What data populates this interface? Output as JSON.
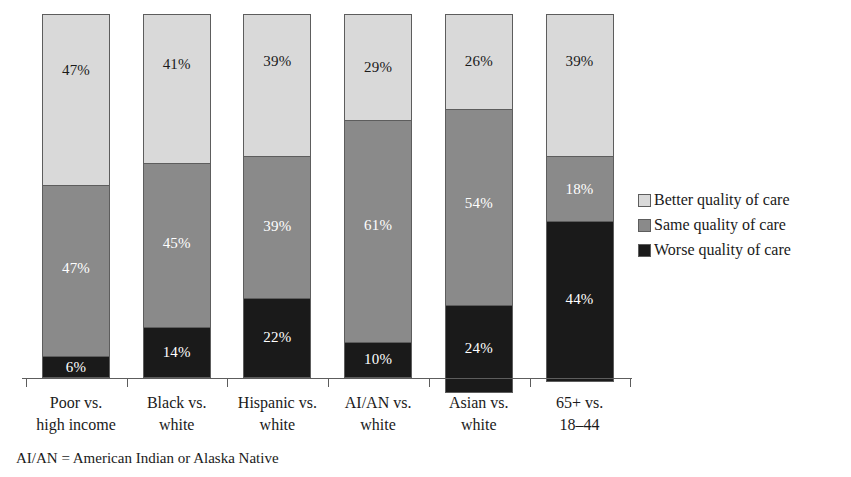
{
  "chart_data": {
    "type": "bar",
    "subtype": "stacked-100-percent",
    "title": "",
    "subtitle": "",
    "xlabel": "",
    "ylabel": "",
    "ylim": [
      0,
      100
    ],
    "grid": false,
    "legend_position": "right",
    "orientation": "vertical",
    "stack_order_bottom_to_top": [
      "Worse quality of care",
      "Same quality of care",
      "Better quality of care"
    ],
    "categories": [
      "Poor vs. high income",
      "Black vs. white",
      "Hispanic vs. white",
      "AI/AN vs. white",
      "Asian vs. white",
      "65+ vs. 18–44"
    ],
    "category_lines": [
      [
        "Poor vs.",
        "high income"
      ],
      [
        "Black vs.",
        "white"
      ],
      [
        "Hispanic vs.",
        "white"
      ],
      [
        "AI/AN vs.",
        "white"
      ],
      [
        "Asian vs.",
        "white"
      ],
      [
        "65+ vs.",
        "18–44"
      ]
    ],
    "series": [
      {
        "name": "Better quality of care",
        "color": "#d9d9d9",
        "values": [
          47,
          41,
          39,
          29,
          26,
          39
        ],
        "labels": [
          "47%",
          "41%",
          "39%",
          "29%",
          "26%",
          "39%"
        ]
      },
      {
        "name": "Same quality of care",
        "color": "#8a8a8a",
        "values": [
          47,
          45,
          39,
          61,
          54,
          18
        ],
        "labels": [
          "47%",
          "45%",
          "39%",
          "61%",
          "54%",
          "18%"
        ]
      },
      {
        "name": "Worse quality of care",
        "color": "#1a1a1a",
        "values": [
          6,
          14,
          22,
          10,
          24,
          44
        ],
        "labels": [
          "6%",
          "14%",
          "22%",
          "10%",
          "24%",
          "44%"
        ]
      }
    ],
    "annotations": [
      "AI/AN = American Indian or Alaska Native"
    ]
  },
  "legend": {
    "items": [
      {
        "label": "Better quality of care",
        "swatch": "legend-swatch-better"
      },
      {
        "label": "Same quality of care",
        "swatch": "legend-swatch-same"
      },
      {
        "label": "Worse quality of care",
        "swatch": "legend-swatch-worse"
      }
    ]
  },
  "footnote": {
    "text": "AI/AN = American Indian or Alaska Native"
  },
  "colors": {
    "better": "#d9d9d9",
    "same": "#8a8a8a",
    "worse": "#1a1a1a",
    "outline": "#5d5d5d",
    "text": "#1a1a1a",
    "background": "#ffffff"
  }
}
